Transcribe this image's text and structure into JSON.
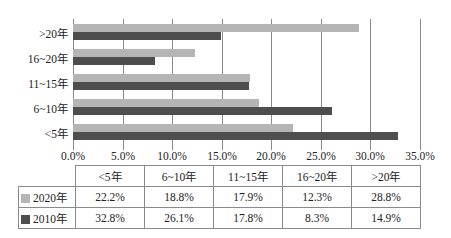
{
  "chart_data": {
    "type": "bar",
    "orientation": "horizontal",
    "title": "",
    "xlabel": "",
    "ylabel": "",
    "categories": [
      "<5年",
      "6~10年",
      "11~15年",
      "16~20年",
      ">20年"
    ],
    "series": [
      {
        "name": "2020年",
        "color": "#b5b5b5",
        "values": [
          22.2,
          18.8,
          17.9,
          12.3,
          28.8
        ]
      },
      {
        "name": "2010年",
        "color": "#4e4e4e",
        "values": [
          32.8,
          26.1,
          17.8,
          8.3,
          14.9
        ]
      }
    ],
    "xlim": [
      0,
      35
    ],
    "x_ticks": [
      "0.0%",
      "5.0%",
      "10.0%",
      "15.0%",
      "20.0%",
      "25.0%",
      "30.0%",
      "35.0%"
    ],
    "grid": true,
    "legend_position": "data-table-below"
  },
  "table": {
    "header": [
      "<5年",
      "6~10年",
      "11~15年",
      "16~20年",
      ">20年"
    ],
    "rows": [
      {
        "label": "2020年",
        "cells": [
          "22.2%",
          "18.8%",
          "17.9%",
          "12.3%",
          "28.8%"
        ]
      },
      {
        "label": "2010年",
        "cells": [
          "32.8%",
          "26.1%",
          "17.8%",
          "8.3%",
          "14.9%"
        ]
      }
    ]
  }
}
